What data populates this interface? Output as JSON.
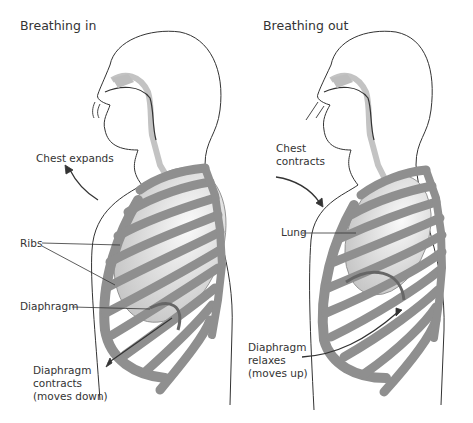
{
  "diagram": {
    "colors": {
      "bone": "#8f8f8f",
      "bone_stroke": "#555555",
      "lung_light": "#f2f2f2",
      "lung_dark": "#c9c9c9",
      "outline": "#333333",
      "airway": "#b5b5b5"
    },
    "panels": [
      {
        "title": "Breathing in",
        "labels": {
          "chest": "Chest expands",
          "ribs": "Ribs",
          "diaphragm": "Diaphragm",
          "diaphragm_action": "Diaphragm\ncontracts\n(moves down)"
        }
      },
      {
        "title": "Breathing out",
        "labels": {
          "chest": "Chest\ncontracts",
          "lung": "Lung",
          "diaphragm_action": "Diaphragm\nrelaxes\n(moves up)"
        }
      }
    ]
  }
}
